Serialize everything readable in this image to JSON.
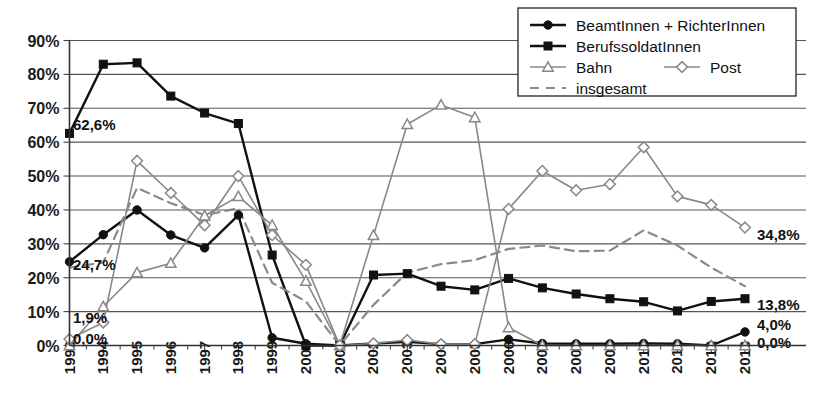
{
  "chart_data": {
    "type": "line",
    "title": "",
    "xlabel": "",
    "ylabel": "",
    "ylim": [
      0,
      90
    ],
    "ytick_labels": [
      "0%",
      "10%",
      "20%",
      "30%",
      "40%",
      "50%",
      "60%",
      "70%",
      "80%",
      "90%"
    ],
    "ytick_values": [
      0,
      10,
      20,
      30,
      40,
      50,
      60,
      70,
      80,
      90
    ],
    "grid": true,
    "legend_position": "top-right",
    "categories": [
      "1993",
      "1994",
      "1995",
      "1996",
      "1997",
      "1998",
      "1999",
      "2000",
      "2001",
      "2002",
      "2003",
      "2004",
      "2005",
      "2006",
      "2007",
      "2008",
      "2009",
      "2010",
      "2011",
      "2012",
      "2013"
    ],
    "series": [
      {
        "name": "BeamtInnen + RichterInnen",
        "marker": "filled-circle",
        "line": "solid",
        "color": "#111111",
        "values": [
          24.7,
          32.7,
          40.0,
          32.6,
          28.8,
          38.5,
          2.3,
          0.5,
          0.0,
          0.6,
          1.1,
          0.4,
          0.4,
          1.8,
          0.6,
          0.5,
          0.5,
          0.6,
          0.5,
          0.0,
          4.0
        ]
      },
      {
        "name": "BerufssoldatInnen",
        "marker": "filled-square",
        "line": "solid",
        "color": "#111111",
        "values": [
          62.6,
          83.0,
          83.4,
          73.6,
          68.6,
          65.5,
          26.7,
          0.0,
          0.0,
          20.8,
          21.2,
          17.5,
          16.4,
          19.8,
          17.0,
          15.2,
          13.8,
          12.9,
          10.2,
          13.0,
          13.8
        ]
      },
      {
        "name": "Bahn",
        "marker": "open-triangle",
        "line": "solid",
        "color": "#888888",
        "values": [
          0.0,
          11.5,
          21.5,
          24.3,
          38.3,
          44.0,
          35.5,
          19.0,
          0.0,
          32.5,
          65.3,
          71.0,
          67.3,
          5.3,
          0.0,
          0.0,
          0.0,
          0.0,
          0.0,
          0.0,
          0.0
        ]
      },
      {
        "name": "Post",
        "marker": "open-diamond",
        "line": "solid",
        "color": "#888888",
        "values": [
          1.9,
          6.8,
          54.5,
          45.0,
          35.5,
          50.0,
          32.6,
          23.8,
          0.0,
          0.6,
          1.6,
          0.4,
          0.4,
          40.3,
          51.5,
          45.8,
          47.6,
          58.5,
          44.0,
          41.5,
          34.8
        ]
      },
      {
        "name": "insgesamt",
        "marker": "none",
        "line": "dashed",
        "color": "#8a8a8a",
        "values": [
          23.0,
          24.5,
          46.5,
          42.0,
          38.5,
          40.5,
          18.5,
          13.0,
          0.0,
          12.0,
          21.5,
          24.0,
          25.2,
          28.5,
          29.5,
          27.8,
          28.0,
          34.0,
          29.5,
          23.0,
          17.5
        ]
      }
    ],
    "annotations": [
      {
        "text": "62,6%",
        "value": 62.6,
        "series": "BerufssoldatInnen",
        "position": "left"
      },
      {
        "text": "24,7%",
        "value": 24.7,
        "series": "BeamtInnen + RichterInnen",
        "position": "left"
      },
      {
        "text": "1,9%",
        "value": 1.9,
        "series": "Post",
        "position": "left"
      },
      {
        "text": "0,0%",
        "value": 0.0,
        "series": "Bahn",
        "position": "left"
      },
      {
        "text": "34,8%",
        "value": 34.8,
        "series": "Post",
        "position": "right"
      },
      {
        "text": "13,8%",
        "value": 13.8,
        "series": "BerufssoldatInnen",
        "position": "right"
      },
      {
        "text": "4,0%",
        "value": 4.0,
        "series": "BeamtInnen + RichterInnen",
        "position": "right"
      },
      {
        "text": "0,0%",
        "value": 0.0,
        "series": "Bahn",
        "position": "right"
      }
    ]
  },
  "legend": {
    "entries": [
      {
        "label": "BeamtInnen + RichterInnen",
        "marker": "filled-circle"
      },
      {
        "label": "BerufssoldatInnen",
        "marker": "filled-square"
      },
      {
        "label": "Bahn",
        "marker": "open-triangle"
      },
      {
        "label": "Post",
        "marker": "open-diamond"
      },
      {
        "label": "insgesamt",
        "marker": "dashed-line"
      }
    ]
  }
}
